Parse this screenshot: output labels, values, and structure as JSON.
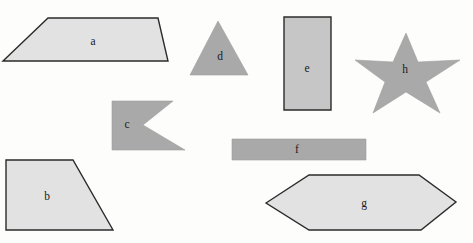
{
  "figure": {
    "background_color": "#fdfdfb",
    "width": 473,
    "height": 243,
    "fill_light": "#e2e2e2",
    "fill_medium": "#a9a9a9",
    "stroke_dark": "#2b2b2b"
  },
  "shapes": [
    {
      "id": "a",
      "label": "a",
      "kind": "trapezoid",
      "fill": "#e2e2e2",
      "stroke": "#2b2b2b",
      "stroke_width": 1.4,
      "points": "3,61 48,18 158,18 168,61",
      "label_x": 93,
      "label_y": 42
    },
    {
      "id": "b",
      "label": "b",
      "kind": "trapezoid",
      "fill": "#e2e2e2",
      "stroke": "#2b2b2b",
      "stroke_width": 1.4,
      "points": "6,160 73,160 113,230 6,230",
      "label_x": 47,
      "label_y": 197
    },
    {
      "id": "c",
      "label": "c",
      "kind": "concave-pennant",
      "fill": "#a9a9a9",
      "stroke": "#a0a0a0",
      "stroke_width": 0.6,
      "points": "112,101 173,101 143,125 185,150 112,150",
      "label_x": 127,
      "label_y": 125
    },
    {
      "id": "d",
      "label": "d",
      "kind": "triangle",
      "fill": "#a9a9a9",
      "stroke": "#a0a0a0",
      "stroke_width": 0.6,
      "points": "218,21 248,75 190,75",
      "label_x": 220,
      "label_y": 57
    },
    {
      "id": "e",
      "label": "e",
      "kind": "rectangle",
      "fill": "#c6c6c6",
      "stroke": "#2b2b2b",
      "stroke_width": 1.4,
      "points": "284,17 331,17 331,110 284,110",
      "label_x": 307,
      "label_y": 69
    },
    {
      "id": "f",
      "label": "f",
      "kind": "rectangle",
      "fill": "#a9a9a9",
      "stroke": "#a0a0a0",
      "stroke_width": 0.6,
      "points": "232,139 366,139 366,160 232,160",
      "label_x": 297,
      "label_y": 150
    },
    {
      "id": "g",
      "label": "g",
      "kind": "hexagon",
      "fill": "#e2e2e2",
      "stroke": "#2b2b2b",
      "stroke_width": 1.4,
      "points": "266,203 309,175 419,175 456,202 421,230 309,230",
      "label_x": 364,
      "label_y": 204
    },
    {
      "id": "h",
      "label": "h",
      "kind": "five-point-star",
      "fill": "#a9a9a9",
      "stroke": "#a0a0a0",
      "stroke_width": 0.6,
      "points": "406,33 418,62 460,60 426,82 440,113 406,92 373,113 385,82 355,60 393,62",
      "label_x": 405,
      "label_y": 70
    }
  ]
}
